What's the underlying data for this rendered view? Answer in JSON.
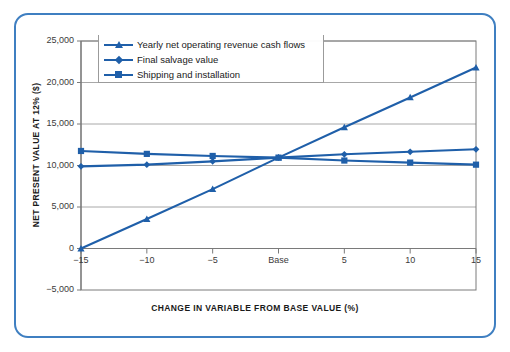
{
  "figure": {
    "frame_color": "#3f7fc1",
    "series_color": "#1f5fa9",
    "grid_color": "#a8a8a8",
    "axis_color": "#7a7a7a"
  },
  "chart_data": {
    "type": "line",
    "title": "",
    "xlabel": "CHANGE IN VARIABLE FROM BASE VALUE (%)",
    "ylabel": "NET PRESENT VALUE AT 12% ($)",
    "x": [
      -15,
      -10,
      -5,
      0,
      5,
      10,
      15
    ],
    "xtick_labels": [
      "−15",
      "−10",
      "−5",
      "Base",
      "5",
      "10",
      "15"
    ],
    "ytick_labels": [
      "25,000",
      "20,000",
      "15,000",
      "10,000",
      "5,000",
      "0",
      "−5,000"
    ],
    "ytick_values": [
      25000,
      20000,
      15000,
      10000,
      5000,
      0,
      -5000
    ],
    "xlim": [
      -15,
      15
    ],
    "ylim": [
      -5000,
      25000
    ],
    "grid": true,
    "legend_position": "upper-left-inside",
    "series": [
      {
        "name": "Yearly net operating revenue cash flows",
        "marker": "triangle",
        "values": [
          0,
          3550,
          7150,
          10950,
          14600,
          18200,
          21800
        ]
      },
      {
        "name": "Final salvage value",
        "marker": "diamond",
        "values": [
          9900,
          10100,
          10500,
          10950,
          11350,
          11650,
          11950
        ]
      },
      {
        "name": "Shipping and installation",
        "marker": "square",
        "values": [
          11750,
          11400,
          11150,
          10950,
          10600,
          10350,
          10100
        ]
      }
    ]
  }
}
